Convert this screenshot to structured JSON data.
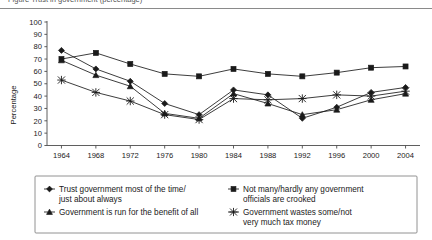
{
  "figure": {
    "clipped_top_text": "Figure    Trust in government (percentage)",
    "axis_title_y": "Percentage"
  },
  "chart_data": {
    "type": "line",
    "title": "",
    "xlabel": "",
    "ylabel": "Percentage",
    "ylim": [
      0,
      100
    ],
    "ytick_step": 10,
    "yticks": [
      "0",
      "10",
      "20",
      "30",
      "40",
      "50",
      "60",
      "70",
      "80",
      "90",
      "100"
    ],
    "grid": false,
    "legend_position": "bottom",
    "categories": [
      "1964",
      "1968",
      "1972",
      "1976",
      "1980",
      "1984",
      "1988",
      "1992",
      "1996",
      "2000",
      "2004"
    ],
    "series": [
      {
        "name": "Trust government most of the time/ just about always",
        "marker": "diamond",
        "values": [
          77,
          62,
          52,
          34,
          25,
          45,
          41,
          22,
          31,
          43,
          47
        ]
      },
      {
        "name": "Not many/hardly any government officials are crooked",
        "marker": "square",
        "values": [
          70,
          75,
          66,
          58,
          56,
          62,
          58,
          56,
          59,
          63,
          64
        ]
      },
      {
        "name": "Government is run for the benefit of all",
        "marker": "triangle",
        "values": [
          69,
          57,
          48,
          26,
          22,
          42,
          34,
          25,
          29,
          37,
          42
        ]
      },
      {
        "name": "Government wastes some/not very much tax money",
        "marker": "cross",
        "values": [
          53,
          43,
          36,
          25,
          21,
          38,
          37,
          38,
          41,
          40,
          44
        ]
      }
    ]
  },
  "legend": {
    "entries": [
      {
        "label": "Trust government most of the time/",
        "label2": "just about always",
        "marker": "diamond"
      },
      {
        "label": "Not many/hardly any government",
        "label2": "officials are crooked",
        "marker": "square"
      },
      {
        "label": "Government is run for the benefit of all",
        "label2": "",
        "marker": "triangle"
      },
      {
        "label": "Government wastes some/not",
        "label2": "very much tax money",
        "marker": "cross"
      }
    ]
  }
}
